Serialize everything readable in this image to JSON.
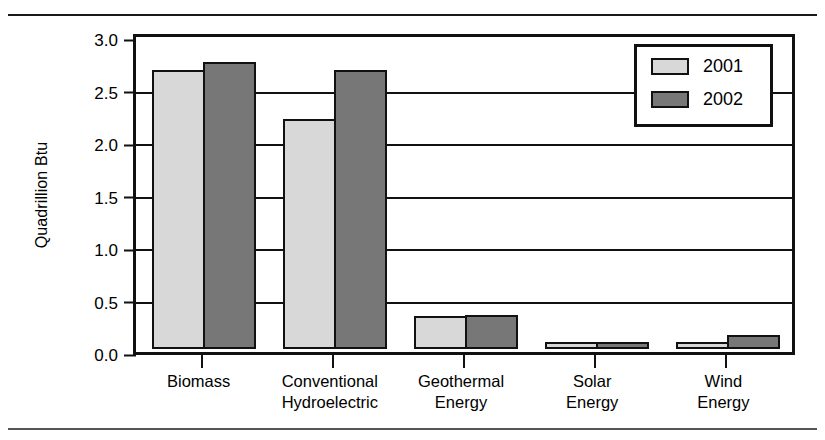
{
  "chart_data": {
    "type": "bar",
    "title": "",
    "xlabel": "",
    "ylabel": "Quadrillion Btu",
    "ylim": [
      0.0,
      3.0
    ],
    "ytick_labels": [
      "3.0",
      "2.5",
      "2.0",
      "1.5",
      "1.0",
      "0.5",
      "0.0"
    ],
    "ytick_values": [
      3.0,
      2.5,
      2.0,
      1.5,
      1.0,
      0.5,
      0.0
    ],
    "grid": "horizontal",
    "legend_position": "top-right",
    "categories": [
      "Biomass",
      "Conventional Hydroelectric",
      "Geothermal Energy",
      "Solar Energy",
      "Wind Energy"
    ],
    "category_lines": [
      [
        "Biomass"
      ],
      [
        "Conventional",
        "Hydroelectric"
      ],
      [
        "Geothermal",
        "Energy"
      ],
      [
        "Solar",
        "Energy"
      ],
      [
        "Wind",
        "Energy"
      ]
    ],
    "series": [
      {
        "name": "2001",
        "color": "#d8d8d8",
        "values": [
          2.66,
          2.19,
          0.31,
          0.07,
          0.07
        ]
      },
      {
        "name": "2002",
        "color": "#777777",
        "values": [
          2.73,
          2.66,
          0.32,
          0.07,
          0.13
        ]
      }
    ]
  },
  "legend": {
    "items": [
      {
        "label": "2001",
        "color": "#d8d8d8"
      },
      {
        "label": "2002",
        "color": "#777777"
      }
    ]
  },
  "axes": {
    "y_title": "Quadrillion Btu"
  }
}
